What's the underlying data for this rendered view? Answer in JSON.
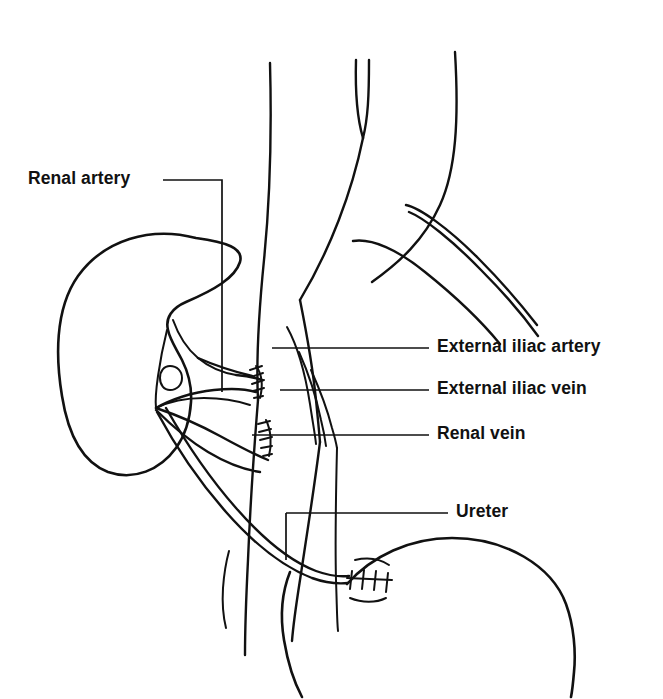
{
  "figure": {
    "type": "anatomical-line-diagram",
    "background_color": "#ffffff",
    "line_color": "#111111",
    "width": 663,
    "height": 699
  },
  "labels": {
    "renal_artery": "Renal artery",
    "external_iliac_artery": "External iliac artery",
    "external_iliac_vein": "External iliac vein",
    "renal_vein": "Renal vein",
    "ureter": "Ureter"
  },
  "structures": {
    "kidney": "transplanted-kidney",
    "bladder": "urinary-bladder",
    "aorta": "aorta",
    "vena_cava": "inferior-vena-cava",
    "iliac_artery": "external-iliac-artery-vessel",
    "iliac_vein": "external-iliac-vein-vessel",
    "renal_artery_vessel": "renal-artery-vessel",
    "renal_vein_vessel": "renal-vein-vessel",
    "ureter_vessel": "ureter-tube",
    "body_wall": "body-wall-contour"
  },
  "anastomoses": [
    {
      "name": "renal-artery-anastomosis",
      "site": "external iliac artery"
    },
    {
      "name": "renal-vein-anastomosis",
      "site": "external iliac vein"
    },
    {
      "name": "ureteroneocystostomy",
      "site": "bladder"
    }
  ]
}
